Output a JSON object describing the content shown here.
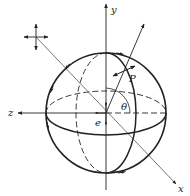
{
  "diagram": {
    "type": "sphere-coordinate-diagram",
    "labels": {
      "y_axis": "y",
      "z_axis": "z",
      "x_axis": "x",
      "point": "P",
      "angle": "θ",
      "center": "e"
    },
    "colors": {
      "stroke": "#222222",
      "background": "#ffffff"
    }
  }
}
